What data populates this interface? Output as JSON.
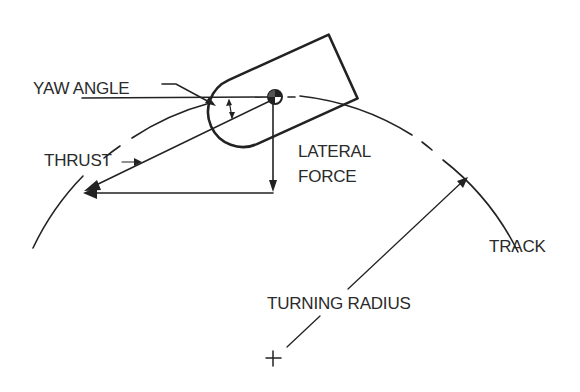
{
  "figure": {
    "type": "technical-diagram",
    "labels": {
      "yaw_angle": "YAW ANGLE",
      "thrust": "THRUST",
      "lateral_force_line1": "LATERAL",
      "lateral_force_line2": "FORCE",
      "track": "TRACK",
      "turning_radius": "TURNING RADIUS"
    },
    "symbols": {
      "center_of_gravity": "cg-symbol",
      "turn_center": "+"
    },
    "colors": {
      "ink": "#222222",
      "background": "#ffffff"
    }
  }
}
